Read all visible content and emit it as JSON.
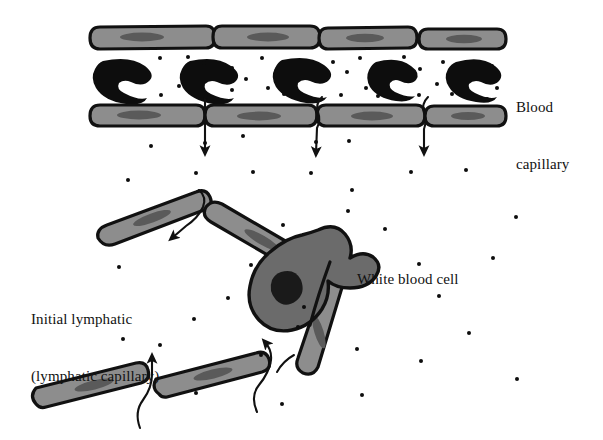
{
  "figure": {
    "type": "biological-diagram",
    "background_color": "#ffffff",
    "width": 603,
    "height": 440
  },
  "labels": [
    {
      "id": "blood-capillary",
      "lines": [
        "Blood",
        "capillary"
      ],
      "x": 516,
      "y": 60
    },
    {
      "id": "white-blood-cell",
      "lines": [
        "White blood cell"
      ],
      "x": 357,
      "y": 232
    },
    {
      "id": "initial-lymphatic",
      "lines": [
        "Initial lymphatic",
        "(lymphatic capillary)"
      ],
      "x": 31,
      "y": 272
    }
  ],
  "colors": {
    "outline": "#111111",
    "endothelial_fill": "#8d8d8d",
    "endothelial_nucleus": "#5a5a5a",
    "white_blood_cell_fill": "#6b6b6b",
    "white_blood_cell_nucleus": "#1a1a1a",
    "red_blood_cell_fill": "#0d0d0d",
    "interstitial_fluid_particle": "#0d0d0d",
    "arrow": "#111111",
    "background": "#ffffff"
  },
  "structures": {
    "blood_capillary": {
      "name": "Blood capillary",
      "top_wall_cells": 4,
      "bottom_wall_cells": 4,
      "lumen_top": 52,
      "lumen_bottom": 104,
      "red_blood_cells": 5
    },
    "initial_lymphatic": {
      "name": "Initial lymphatic (lymphatic capillary)",
      "endothelial_cells": 5,
      "overlapping_junctions": 3
    },
    "white_blood_cell": {
      "name": "White blood cell",
      "nucleus": true
    },
    "arrows": {
      "capillary_outflow_count": 3,
      "lymphatic_inflow_count": 3,
      "direction_capillary": "downward",
      "direction_lymphatic": "upward-into-vessel"
    }
  },
  "endothelial_cells_top": [
    {
      "x": 96,
      "y": 26,
      "w": 118,
      "h": 22
    },
    {
      "x": 216,
      "y": 26,
      "w": 102,
      "h": 22
    },
    {
      "x": 320,
      "y": 26,
      "w": 96,
      "h": 22
    },
    {
      "x": 418,
      "y": 26,
      "w": 86,
      "h": 22
    }
  ],
  "endothelial_cells_bottom": [
    {
      "x": 96,
      "y": 104,
      "w": 108,
      "h": 22
    },
    {
      "x": 206,
      "y": 104,
      "w": 110,
      "h": 22
    },
    {
      "x": 318,
      "y": 104,
      "w": 106,
      "h": 22
    },
    {
      "x": 426,
      "y": 104,
      "w": 78,
      "h": 22
    }
  ],
  "red_blood_cells": [
    {
      "cx": 123,
      "cy": 79
    },
    {
      "cx": 210,
      "cy": 79
    },
    {
      "cx": 303,
      "cy": 79
    },
    {
      "cx": 392,
      "cy": 79
    },
    {
      "cx": 473,
      "cy": 79
    }
  ],
  "interstitial_particles": [
    {
      "x": 160,
      "y": 58
    },
    {
      "x": 188,
      "y": 57
    },
    {
      "x": 204,
      "y": 63
    },
    {
      "x": 232,
      "y": 68
    },
    {
      "x": 262,
      "y": 58
    },
    {
      "x": 276,
      "y": 71
    },
    {
      "x": 246,
      "y": 79
    },
    {
      "x": 268,
      "y": 88
    },
    {
      "x": 179,
      "y": 86
    },
    {
      "x": 161,
      "y": 95
    },
    {
      "x": 206,
      "y": 97
    },
    {
      "x": 232,
      "y": 90
    },
    {
      "x": 284,
      "y": 94
    },
    {
      "x": 333,
      "y": 62
    },
    {
      "x": 347,
      "y": 72
    },
    {
      "x": 360,
      "y": 58
    },
    {
      "x": 366,
      "y": 88
    },
    {
      "x": 341,
      "y": 95
    },
    {
      "x": 378,
      "y": 96
    },
    {
      "x": 404,
      "y": 57
    },
    {
      "x": 420,
      "y": 69
    },
    {
      "x": 443,
      "y": 62
    },
    {
      "x": 437,
      "y": 84
    },
    {
      "x": 452,
      "y": 94
    },
    {
      "x": 419,
      "y": 95
    },
    {
      "x": 492,
      "y": 66
    },
    {
      "x": 497,
      "y": 88
    },
    {
      "x": 487,
      "y": 99
    },
    {
      "x": 151,
      "y": 146
    },
    {
      "x": 205,
      "y": 143
    },
    {
      "x": 243,
      "y": 136
    },
    {
      "x": 316,
      "y": 142
    },
    {
      "x": 349,
      "y": 141
    },
    {
      "x": 128,
      "y": 180
    },
    {
      "x": 196,
      "y": 173
    },
    {
      "x": 253,
      "y": 172
    },
    {
      "x": 311,
      "y": 173
    },
    {
      "x": 411,
      "y": 172
    },
    {
      "x": 466,
      "y": 170
    },
    {
      "x": 352,
      "y": 190
    },
    {
      "x": 283,
      "y": 225
    },
    {
      "x": 348,
      "y": 211
    },
    {
      "x": 516,
      "y": 217
    },
    {
      "x": 119,
      "y": 267
    },
    {
      "x": 385,
      "y": 229
    },
    {
      "x": 251,
      "y": 265
    },
    {
      "x": 419,
      "y": 264
    },
    {
      "x": 493,
      "y": 258
    },
    {
      "x": 228,
      "y": 298
    },
    {
      "x": 304,
      "y": 307
    },
    {
      "x": 439,
      "y": 296
    },
    {
      "x": 194,
      "y": 319
    },
    {
      "x": 123,
      "y": 339
    },
    {
      "x": 160,
      "y": 345
    },
    {
      "x": 357,
      "y": 349
    },
    {
      "x": 261,
      "y": 355
    },
    {
      "x": 298,
      "y": 327
    },
    {
      "x": 469,
      "y": 333
    },
    {
      "x": 421,
      "y": 361
    },
    {
      "x": 517,
      "y": 379
    },
    {
      "x": 362,
      "y": 395
    },
    {
      "x": 282,
      "y": 404
    },
    {
      "x": 196,
      "y": 393
    }
  ]
}
